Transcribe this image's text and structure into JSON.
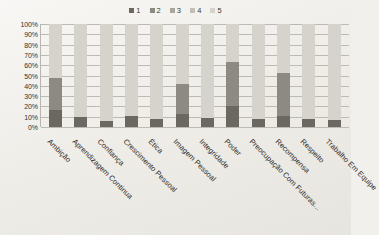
{
  "chart_data": {
    "type": "bar",
    "subtype": "100% stacked bar",
    "title": "",
    "xlabel": "",
    "ylabel": "",
    "ylim": [
      0,
      100
    ],
    "ytick_labels": [
      "100%",
      "90%",
      "80%",
      "70%",
      "60%",
      "50%",
      "40%",
      "30%",
      "20%",
      "10%",
      "0%"
    ],
    "ytick_values": [
      100,
      90,
      80,
      70,
      60,
      50,
      40,
      30,
      20,
      10,
      0
    ],
    "grid": true,
    "legend_position": "top-center",
    "legend": [
      "1",
      "2",
      "3",
      "4",
      "5"
    ],
    "categories": [
      "Ambição",
      "Aprendizagem Continua",
      "Confiança",
      "Crescimento Pessoal",
      "Ética",
      "Imagem Pessoal",
      "Integridade",
      "Poder",
      "Preocupação Com Futuras...",
      "Recompensa",
      "Respeito",
      "Trabalho Em Equipe"
    ],
    "series": [
      {
        "name": "1",
        "color": "#6b6862",
        "values": [
          17,
          10,
          6,
          11,
          8,
          13,
          9,
          20,
          8,
          11,
          8,
          7
        ]
      },
      {
        "name": "2",
        "color": "#8d8a84",
        "values": [
          31,
          0,
          0,
          0,
          0,
          29,
          0,
          43,
          0,
          41,
          0,
          0
        ]
      },
      {
        "name": "3",
        "color": "#a9a6a0",
        "values": [
          0,
          0,
          0,
          0,
          0,
          0,
          0,
          0,
          0,
          0,
          0,
          0
        ]
      },
      {
        "name": "4",
        "color": "#c2bfb9",
        "values": [
          0,
          0,
          0,
          0,
          0,
          0,
          0,
          0,
          0,
          0,
          0,
          0
        ]
      },
      {
        "name": "5",
        "color": "#d6d3cd",
        "values": [
          52,
          90,
          94,
          89,
          92,
          58,
          91,
          37,
          92,
          48,
          92,
          93
        ]
      }
    ]
  },
  "colors": {
    "background": "#efedE8",
    "axis": "#b9b6b0",
    "grid": "#bdbab4",
    "text": "#2f2c28"
  }
}
